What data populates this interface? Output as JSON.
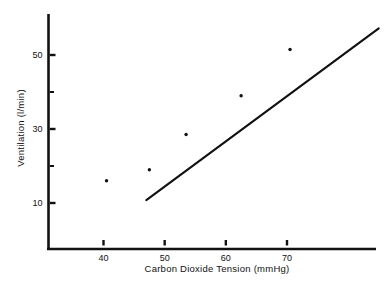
{
  "chart_data": {
    "type": "scatter",
    "title": "",
    "subtitle": "",
    "xlabel": "Carbon Dioxide Tension  (mmHg)",
    "ylabel": "Ventilation (l/min)",
    "xlim": [
      34,
      88
    ],
    "ylim": [
      1,
      59
    ],
    "grid": false,
    "legend": "none",
    "x_ticks": [
      {
        "value": 40,
        "label": "40"
      },
      {
        "value": 50,
        "label": "50"
      },
      {
        "value": 60,
        "label": "60"
      },
      {
        "value": 70,
        "label": "70"
      }
    ],
    "y_ticks_major": [
      {
        "value": 10,
        "label": "10"
      },
      {
        "value": 30,
        "label": "30"
      },
      {
        "value": 50,
        "label": "50"
      }
    ],
    "y_ticks_minor": [
      {
        "value": 20,
        "label": ""
      },
      {
        "value": 40,
        "label": ""
      }
    ],
    "series": [
      {
        "name": "observations",
        "type": "scatter",
        "marker": "filled-circle",
        "marker_color": "#111111",
        "marker_size_px": 3.4,
        "x": [
          40.5,
          47.5,
          53.5,
          62.5,
          70.5
        ],
        "y": [
          16.0,
          19.0,
          28.5,
          39.0,
          51.5
        ],
        "points": [
          {
            "x": 40.5,
            "y": 16.0
          },
          {
            "x": 47.5,
            "y": 19.0
          },
          {
            "x": 53.5,
            "y": 28.5
          },
          {
            "x": 62.5,
            "y": 39.0
          },
          {
            "x": 70.5,
            "y": 51.5
          }
        ]
      },
      {
        "name": "regression-line",
        "type": "line",
        "line_color": "#111111",
        "line_width_px": 2.1,
        "x": [
          47.0,
          85.0
        ],
        "y": [
          10.8,
          57.2
        ],
        "slope_per_mmHg": 1.22,
        "endpoints": [
          {
            "x": 47.0,
            "y": 10.8
          },
          {
            "x": 85.0,
            "y": 57.2
          }
        ]
      }
    ],
    "axes": {
      "axis_color": "#111111",
      "x_axis_span": [
        34.0,
        87.5
      ],
      "y_axis_span": [
        1.3,
        58.5
      ],
      "spines": [
        "left",
        "bottom"
      ],
      "tick_direction": "out"
    }
  }
}
